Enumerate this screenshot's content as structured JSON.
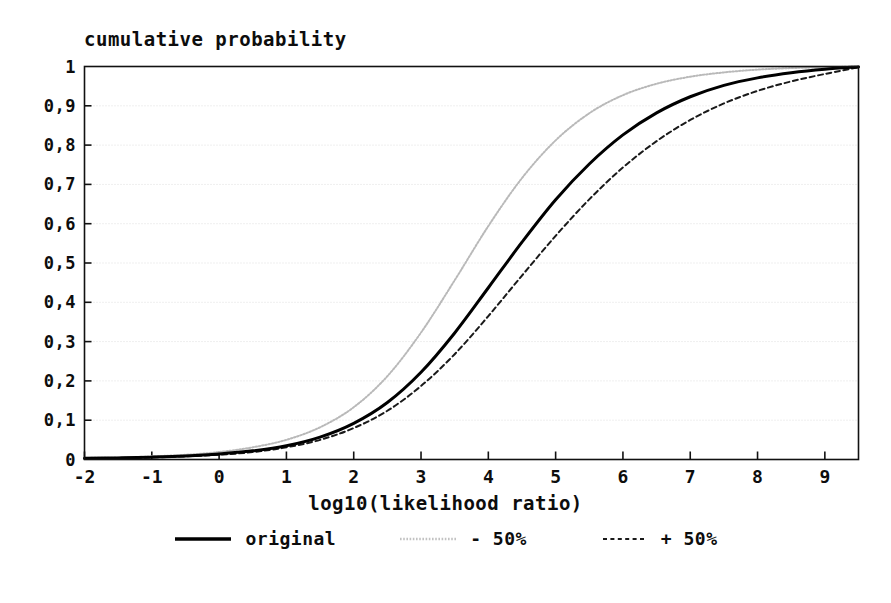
{
  "chart_data": {
    "type": "line",
    "title": "cumulative probability",
    "subtitle": "",
    "xlabel": "log10(likelihood ratio)",
    "ylabel": "cumulative probability",
    "xlim": [
      -2,
      9.5
    ],
    "ylim": [
      0,
      1
    ],
    "grid": true,
    "grid_axis": "y",
    "legend_position": "bottom",
    "xticks": [
      -2,
      -1,
      0,
      1,
      2,
      3,
      4,
      5,
      6,
      7,
      8,
      9
    ],
    "xtick_labels": [
      "-2",
      "-1",
      "0",
      "1",
      "2",
      "3",
      "4",
      "5",
      "6",
      "7",
      "8",
      "9"
    ],
    "yticks": [
      0,
      0.1,
      0.2,
      0.3,
      0.4,
      0.5,
      0.6,
      0.7,
      0.8,
      0.9,
      1
    ],
    "ytick_labels": [
      "0",
      "0,1",
      "0,2",
      "0,3",
      "0,4",
      "0,5",
      "0,6",
      "0,7",
      "0,8",
      "0,9",
      "1"
    ],
    "x": [
      -2,
      -1.5,
      -1,
      -0.5,
      0,
      0.5,
      1,
      1.5,
      2,
      2.5,
      3,
      3.5,
      4,
      4.5,
      5,
      5.5,
      6,
      6.5,
      7,
      7.5,
      8,
      8.5,
      9,
      9.5
    ],
    "series": [
      {
        "name": "original",
        "style": "solid",
        "color": "#000000",
        "width": 3,
        "values": [
          0.003,
          0.004,
          0.006,
          0.009,
          0.014,
          0.022,
          0.035,
          0.057,
          0.092,
          0.145,
          0.222,
          0.322,
          0.437,
          0.553,
          0.661,
          0.752,
          0.826,
          0.882,
          0.923,
          0.952,
          0.971,
          0.984,
          0.993,
          0.999
        ]
      },
      {
        "name": "- 50%",
        "style": "dotted",
        "color": "#b9b9b9",
        "width": 2,
        "values": [
          0.004,
          0.005,
          0.008,
          0.012,
          0.019,
          0.031,
          0.05,
          0.082,
          0.133,
          0.212,
          0.323,
          0.456,
          0.594,
          0.716,
          0.812,
          0.881,
          0.927,
          0.956,
          0.974,
          0.985,
          0.992,
          0.996,
          0.998,
          1.0
        ]
      },
      {
        "name": "+ 50%",
        "style": "dashed",
        "color": "#1a1a1a",
        "width": 2,
        "values": [
          0.002,
          0.003,
          0.005,
          0.008,
          0.012,
          0.019,
          0.031,
          0.05,
          0.08,
          0.124,
          0.187,
          0.268,
          0.365,
          0.468,
          0.569,
          0.662,
          0.743,
          0.81,
          0.864,
          0.906,
          0.938,
          0.962,
          0.981,
          0.998
        ]
      }
    ]
  },
  "legend": {
    "items": [
      {
        "label": "original",
        "style": "solid"
      },
      {
        "label": "- 50%",
        "style": "dotted"
      },
      {
        "label": "+ 50%",
        "style": "dashed"
      }
    ]
  },
  "colors": {
    "background": "#ffffff",
    "axis": "#111111",
    "grid": "#dedede",
    "original": "#000000",
    "minus50": "#b9b9b9",
    "plus50": "#1a1a1a"
  }
}
